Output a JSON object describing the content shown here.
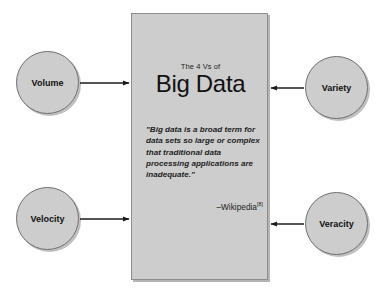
{
  "diagram": {
    "title": "The 4 Vs of Big Data",
    "background_color": "#ffffff",
    "shape_fill_color": "#cdcdcd",
    "shape_border_color": "#6f6f6f",
    "text_color": "#111111"
  },
  "panel": {
    "subtitle": "The 4 Vs of",
    "title": "Big Data",
    "quote": "\"Big data is a broad term for data sets so large or complex that traditional data processing applications are inadequate.\"",
    "attribution": "–Wikipedia",
    "attribution_reference": "[8]"
  },
  "nodes": [
    {
      "id": "volume",
      "label": "Volume",
      "position": "top-left",
      "arrow_direction": "right"
    },
    {
      "id": "variety",
      "label": "Variety",
      "position": "top-right",
      "arrow_direction": "left"
    },
    {
      "id": "velocity",
      "label": "Velocity",
      "position": "bottom-left",
      "arrow_direction": "right"
    },
    {
      "id": "veracity",
      "label": "Veracity",
      "position": "bottom-right",
      "arrow_direction": "left"
    }
  ]
}
